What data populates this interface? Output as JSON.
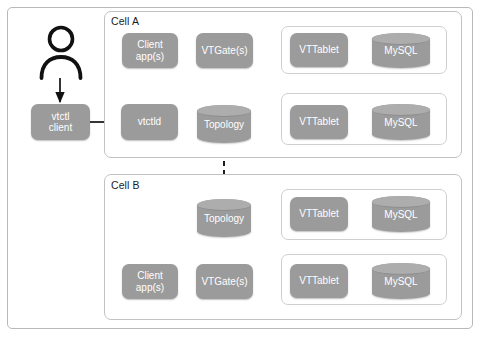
{
  "diagram": {
    "palette": {
      "node_fill": "#9b9b9b",
      "node_text": "#ffffff",
      "frame_border": "#b9b9b9",
      "cell_border": "#c2c2c2",
      "shard_border": "#cfcfcf",
      "arrow": "#111111",
      "background": "#ffffff"
    },
    "actor": {
      "name": "user-actor",
      "label": ""
    },
    "external": {
      "vtctl_client": "vtctl\nclient",
      "vtctl_client_line1": "vtctl",
      "vtctl_client_line2": "client"
    },
    "cells": [
      {
        "label": "Cell A",
        "client_app_line1": "Client",
        "client_app_line2": "app(s)",
        "vtctld": "vtctld",
        "vtgate": "VTGate(s)",
        "topology": "Topology",
        "shards": [
          {
            "vttablet": "VTTablet",
            "mysql": "MySQL"
          },
          {
            "vttablet": "VTTablet",
            "mysql": "MySQL"
          }
        ]
      },
      {
        "label": "Cell B",
        "client_app_line1": "Client",
        "client_app_line2": "app(s)",
        "vtgate": "VTGate(s)",
        "topology": "Topology",
        "shards": [
          {
            "vttablet": "VTTablet",
            "mysql": "MySQL"
          },
          {
            "vttablet": "VTTablet",
            "mysql": "MySQL"
          }
        ]
      }
    ],
    "connections": [
      {
        "from": "user-actor",
        "to": "vtctl-client",
        "style": "solid"
      },
      {
        "from": "vtctl-client",
        "to": "cell-a-vtctld",
        "style": "solid"
      },
      {
        "from": "cell-a-vtctld",
        "to": "cell-a-topology",
        "style": "solid"
      },
      {
        "from": "cell-a-client-app",
        "to": "cell-a-vtgate",
        "style": "solid"
      },
      {
        "from": "cell-a-vtgate",
        "to": "cell-a-topology",
        "style": "solid"
      },
      {
        "from": "cell-a-vtgate",
        "to": "cell-a-shard-1-vttablet",
        "style": "solid"
      },
      {
        "from": "cell-a-vtgate",
        "to": "cell-a-shard-2-vttablet",
        "style": "solid"
      },
      {
        "from": "cell-a-shard-1-vttablet",
        "to": "cell-a-shard-1-mysql",
        "style": "solid"
      },
      {
        "from": "cell-a-shard-2-vttablet",
        "to": "cell-a-shard-2-mysql",
        "style": "solid"
      },
      {
        "from": "cell-a-topology",
        "to": "cell-b-topology",
        "style": "dashed"
      },
      {
        "from": "cell-b-client-app",
        "to": "cell-b-vtgate",
        "style": "solid"
      },
      {
        "from": "cell-b-vtgate",
        "to": "cell-b-topology",
        "style": "solid"
      },
      {
        "from": "cell-b-vtgate",
        "to": "cell-b-shard-1-vttablet",
        "style": "solid"
      },
      {
        "from": "cell-b-vtgate",
        "to": "cell-b-shard-2-vttablet",
        "style": "solid"
      },
      {
        "from": "cell-b-shard-1-vttablet",
        "to": "cell-b-shard-1-mysql",
        "style": "solid"
      },
      {
        "from": "cell-b-shard-2-vttablet",
        "to": "cell-b-shard-2-mysql",
        "style": "solid"
      }
    ]
  }
}
